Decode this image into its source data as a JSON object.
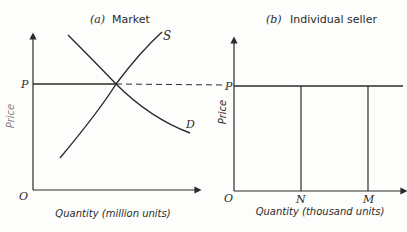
{
  "panel_a": {
    "title_prefix": "(a)",
    "title": "Market",
    "x_axis_label": "Quantity (million units)",
    "y_axis_label": "Price",
    "origin_label": "O",
    "price_label": "P",
    "supply_label": "S",
    "demand_label": "D"
  },
  "panel_b": {
    "title_prefix": "(b)",
    "title": "Individual seller",
    "x_axis_label": "Quantity (thousand units)",
    "y_axis_label": "Price",
    "origin_label": "O",
    "price_label": "P",
    "quantity_n_label": "N",
    "quantity_m_label": "M"
  },
  "colors": {
    "ink": "#2b2b2b",
    "paper": "#fdfdfb"
  }
}
